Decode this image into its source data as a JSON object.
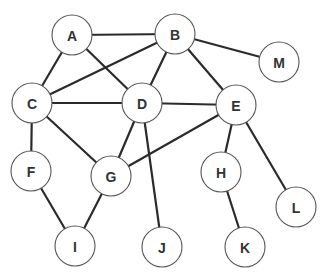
{
  "graph": {
    "node_radius": 20,
    "nodes": [
      {
        "id": "A",
        "label": "A",
        "x": 72,
        "y": 35
      },
      {
        "id": "B",
        "label": "B",
        "x": 175,
        "y": 34
      },
      {
        "id": "M",
        "label": "M",
        "x": 279,
        "y": 62
      },
      {
        "id": "C",
        "label": "C",
        "x": 32,
        "y": 103
      },
      {
        "id": "D",
        "label": "D",
        "x": 142,
        "y": 103
      },
      {
        "id": "E",
        "label": "E",
        "x": 236,
        "y": 105
      },
      {
        "id": "F",
        "label": "F",
        "x": 31,
        "y": 171
      },
      {
        "id": "G",
        "label": "G",
        "x": 111,
        "y": 176
      },
      {
        "id": "H",
        "label": "H",
        "x": 221,
        "y": 172
      },
      {
        "id": "L",
        "label": "L",
        "x": 296,
        "y": 207
      },
      {
        "id": "I",
        "label": "I",
        "x": 75,
        "y": 246
      },
      {
        "id": "J",
        "label": "J",
        "x": 162,
        "y": 247
      },
      {
        "id": "K",
        "label": "K",
        "x": 245,
        "y": 247
      }
    ],
    "edges": [
      [
        "A",
        "B"
      ],
      [
        "A",
        "C"
      ],
      [
        "A",
        "D"
      ],
      [
        "B",
        "C"
      ],
      [
        "B",
        "D"
      ],
      [
        "B",
        "E"
      ],
      [
        "B",
        "M"
      ],
      [
        "C",
        "D"
      ],
      [
        "C",
        "F"
      ],
      [
        "C",
        "G"
      ],
      [
        "D",
        "E"
      ],
      [
        "D",
        "G"
      ],
      [
        "D",
        "J"
      ],
      [
        "E",
        "G"
      ],
      [
        "E",
        "H"
      ],
      [
        "E",
        "L"
      ],
      [
        "F",
        "I"
      ],
      [
        "G",
        "I"
      ],
      [
        "H",
        "K"
      ]
    ]
  }
}
